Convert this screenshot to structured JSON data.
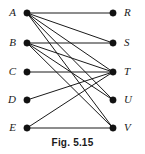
{
  "figure": {
    "caption": "Fig. 5.15",
    "width": 145,
    "height": 154
  },
  "chart_data": {
    "type": "diagram",
    "diagram_type": "bipartite-graph",
    "title": "Fig. 5.15",
    "layout": "two-column bipartite, left set above-to-below, right set above-to-below",
    "left_x": 27,
    "right_x": 113,
    "row_y": [
      13,
      43,
      72,
      100,
      128
    ],
    "nodes": [
      {
        "id": "A",
        "label": "A",
        "side": "left",
        "x": 27,
        "y": 13,
        "degree": 5
      },
      {
        "id": "B",
        "label": "B",
        "side": "left",
        "x": 27,
        "y": 43,
        "degree": 4
      },
      {
        "id": "C",
        "label": "C",
        "side": "left",
        "x": 27,
        "y": 72,
        "degree": 1
      },
      {
        "id": "D",
        "label": "D",
        "side": "left",
        "x": 27,
        "y": 100,
        "degree": 1
      },
      {
        "id": "E",
        "label": "E",
        "side": "left",
        "x": 27,
        "y": 128,
        "degree": 2
      },
      {
        "id": "R",
        "label": "R",
        "side": "right",
        "x": 113,
        "y": 13,
        "degree": 1
      },
      {
        "id": "S",
        "label": "S",
        "side": "right",
        "x": 113,
        "y": 43,
        "degree": 2
      },
      {
        "id": "T",
        "label": "T",
        "side": "right",
        "x": 113,
        "y": 72,
        "degree": 5
      },
      {
        "id": "U",
        "label": "U",
        "side": "right",
        "x": 113,
        "y": 100,
        "degree": 2
      },
      {
        "id": "V",
        "label": "V",
        "side": "right",
        "x": 113,
        "y": 128,
        "degree": 3
      }
    ],
    "edges": [
      {
        "from": "A",
        "to": "R"
      },
      {
        "from": "A",
        "to": "S"
      },
      {
        "from": "A",
        "to": "T"
      },
      {
        "from": "A",
        "to": "U"
      },
      {
        "from": "A",
        "to": "V"
      },
      {
        "from": "B",
        "to": "S"
      },
      {
        "from": "B",
        "to": "T"
      },
      {
        "from": "B",
        "to": "U"
      },
      {
        "from": "B",
        "to": "V"
      },
      {
        "from": "C",
        "to": "T"
      },
      {
        "from": "D",
        "to": "T"
      },
      {
        "from": "E",
        "to": "T"
      },
      {
        "from": "E",
        "to": "V"
      }
    ],
    "colors": {
      "background": "#ffffff",
      "edge": "#1a1a1a",
      "vertex": "#111111",
      "label": "#1a1a1a"
    }
  }
}
